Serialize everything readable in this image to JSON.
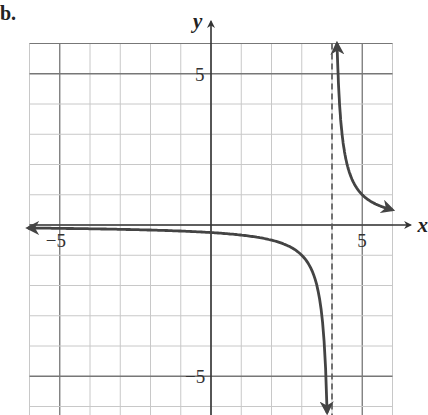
{
  "panel_label": "b.",
  "chart_data": {
    "type": "line",
    "title": "",
    "function": "y = 1/(x - 4)",
    "xlabel": "x",
    "ylabel": "y",
    "xlim": [
      -6,
      6
    ],
    "ylim": [
      -6.3,
      6
    ],
    "grid": true,
    "grid_step": 1,
    "major_grid_step": 5,
    "x_tick_labels": [
      {
        "value": -5,
        "label": "−5"
      },
      {
        "value": 5,
        "label": "5"
      }
    ],
    "y_tick_labels": [
      {
        "value": 5,
        "label": "5"
      },
      {
        "value": -5,
        "label": "−5"
      }
    ],
    "vertical_asymptote": {
      "x": 4,
      "style": "dashed"
    },
    "horizontal_asymptote": {
      "y": 0
    },
    "series": [
      {
        "name": "left branch",
        "x": [
          -6,
          -4,
          -2,
          0,
          2,
          3,
          3.5,
          3.8,
          3.84
        ],
        "y": [
          -0.1,
          -0.125,
          -0.167,
          -0.25,
          -0.5,
          -1,
          -2,
          -5,
          -6.3
        ],
        "arrows": "both ends"
      },
      {
        "name": "right branch",
        "x": [
          4.17,
          4.2,
          4.5,
          5,
          5.5,
          6
        ],
        "y": [
          6,
          5,
          2,
          1,
          0.667,
          0.5
        ],
        "arrows": "both ends"
      }
    ],
    "colors": {
      "curve": "#444444",
      "grid_minor": "#c8c8c8",
      "grid_major": "#777777",
      "axes": "#333333"
    }
  }
}
